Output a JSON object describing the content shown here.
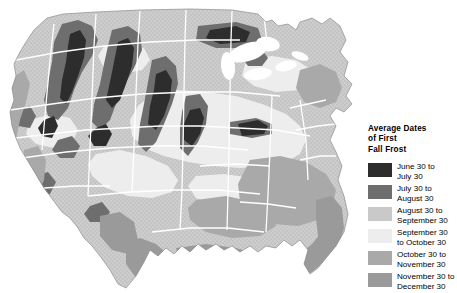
{
  "legend": {
    "title": "Average Dates\nof First\nFall Frost",
    "items": [
      {
        "label": "June 30 to\nJuly 30",
        "color": "#2d2d2d",
        "texture": "solid"
      },
      {
        "label": "July 30 to\nAugust 30",
        "color": "#6e6e6e",
        "texture": "solid"
      },
      {
        "label": "August 30 to\nSeptember 30",
        "color": "#c9c9c9",
        "texture": "stipple"
      },
      {
        "label": "September 30\nto October 30",
        "color": "#ededed",
        "texture": "solid"
      },
      {
        "label": "October 30 to\nNovember 30",
        "color": "#a9a9a9",
        "texture": "solid"
      },
      {
        "label": "November 30 to\nDecember 30",
        "color": "#9a9a9a",
        "texture": "solid"
      }
    ]
  },
  "map": {
    "background": "#ffffff",
    "border_color": "#ffffff",
    "base_fill": "#b4b4b4",
    "lake_fill": "#ffffff",
    "regions": [
      {
        "name": "pacific-northwest-coast",
        "band": 4
      },
      {
        "name": "cascade-range",
        "band": 0
      },
      {
        "name": "northern-rockies",
        "band": 0
      },
      {
        "name": "great-basin",
        "band": 2
      },
      {
        "name": "sierra-nevada",
        "band": 0
      },
      {
        "name": "california-central-valley",
        "band": 4
      },
      {
        "name": "colorado-rockies",
        "band": 0
      },
      {
        "name": "northern-plains",
        "band": 2
      },
      {
        "name": "central-plains",
        "band": 3
      },
      {
        "name": "great-lakes-region",
        "band": 3
      },
      {
        "name": "appalachians",
        "band": 1
      },
      {
        "name": "northeast",
        "band": 2
      },
      {
        "name": "southeast",
        "band": 4
      },
      {
        "name": "gulf-coast",
        "band": 5
      },
      {
        "name": "florida",
        "band": 5
      },
      {
        "name": "south-texas",
        "band": 5
      }
    ]
  }
}
